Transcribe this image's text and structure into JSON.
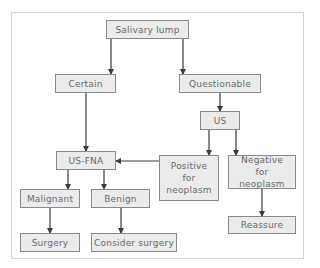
{
  "diagram": {
    "colors": {
      "box_fill": "#ebebeb",
      "box_border": "#8a8a8a",
      "text": "#6a6a6a",
      "arrow": "#3a3a3a",
      "frame": "#d4d4d4"
    },
    "nodes": {
      "salivary_lump": "Salivary lump",
      "certain": "Certain",
      "questionable": "Questionable",
      "us": "US",
      "us_fna": "US-FNA",
      "positive": "Positive for neoplasm",
      "negative": "Negative for neoplasm",
      "malignant": "Malignant",
      "benign": "Benign",
      "surgery": "Surgery",
      "consider_surgery": "Consider surgery",
      "reassure": "Reassure"
    },
    "edges": [
      [
        "Salivary lump",
        "Certain"
      ],
      [
        "Salivary lump",
        "Questionable"
      ],
      [
        "Questionable",
        "US"
      ],
      [
        "Certain",
        "US-FNA"
      ],
      [
        "US",
        "Positive for neoplasm"
      ],
      [
        "US",
        "Negative for neoplasm"
      ],
      [
        "Positive for neoplasm",
        "US-FNA"
      ],
      [
        "US-FNA",
        "Malignant"
      ],
      [
        "US-FNA",
        "Benign"
      ],
      [
        "Malignant",
        "Surgery"
      ],
      [
        "Benign",
        "Consider surgery"
      ],
      [
        "Negative for neoplasm",
        "Reassure"
      ]
    ]
  }
}
